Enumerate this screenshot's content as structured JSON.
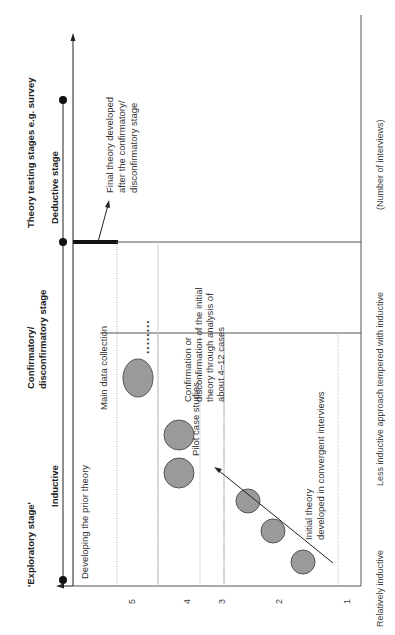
{
  "diagram": {
    "orientation": "rotated 90 degrees counter-clockwise",
    "stages": {
      "exploratory": "'Exploratory stage'",
      "inductive": "Inductive",
      "confirmatory_line1": "Confirmatory/",
      "confirmatory_line2": "disconfirmatory stage",
      "theory_testing": "Theory testing stages e.g. survey",
      "deductive": "Deductive stage"
    },
    "annotations": {
      "developing": "Developing the prior theory",
      "main_data": "Main data collection",
      "pilot": "Pilot case studies",
      "initial_line1": "Initial theory",
      "initial_line2": "developed in convergent interviews",
      "confirm_line1": "Confirmation or",
      "confirm_line2": "disconfirmation of the initial",
      "confirm_line3": "theory through analysis of",
      "confirm_line4": "about 4–12 cases",
      "final_line1": "Final theory developed",
      "final_line2": "after the confirmatory/",
      "final_line3": "disconfirmatory stage",
      "ellipsis": "........"
    },
    "axis_ticks": [
      "1",
      "2",
      "3",
      "4",
      "5"
    ],
    "footer": {
      "left": "Relatively inductive",
      "right": "Less inductive approach tempered with inductive",
      "unit": "(Number of interviews)"
    },
    "colors": {
      "circle_fill": "#9a9a9a",
      "line": "#555555",
      "text": "#333333"
    }
  }
}
